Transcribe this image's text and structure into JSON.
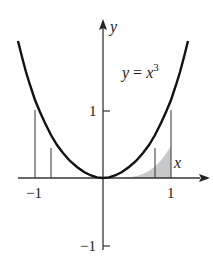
{
  "figure": {
    "equation_label": {
      "lhs": "y",
      "eq": " = ",
      "rhs": "x",
      "exp": "3"
    },
    "axis_labels": {
      "x": "x",
      "y": "y"
    },
    "ticks": {
      "x": [
        {
          "value": -1,
          "label": "−1"
        },
        {
          "value": 1,
          "label": "1"
        }
      ],
      "y": [
        {
          "value": 1,
          "label": "1"
        },
        {
          "value": -1,
          "label": "−1"
        }
      ]
    },
    "curve": "y = |x|^3 for x in [-1.25, 1.25]",
    "vertical_lines_x": [
      -1,
      -0.76,
      0.76,
      1
    ],
    "shaded_region": {
      "from_x": 0.33,
      "to_x": 1,
      "under": "curve",
      "color": "#c8c8c8"
    },
    "colors": {
      "curve": "#111111",
      "axes": "#333333",
      "shade": "#c8c8c8"
    }
  }
}
